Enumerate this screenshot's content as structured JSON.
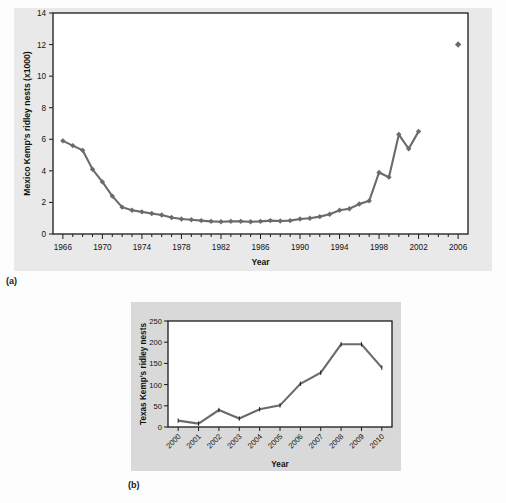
{
  "figure": {
    "panel_a_label": "(a)",
    "panel_b_label": "(b)"
  },
  "chart_data": [
    {
      "id": "panel-a",
      "type": "line",
      "title": "",
      "xlabel": "Year",
      "ylabel": "Mexico Kemp's ridley nests (x1000)",
      "xlim": [
        1965,
        2007
      ],
      "ylim": [
        0,
        14
      ],
      "ytick_values": [
        0,
        2,
        4,
        6,
        8,
        10,
        12,
        14
      ],
      "ytick_labels": [
        "0",
        "2",
        "4",
        "6",
        "8",
        "10",
        "12",
        "14"
      ],
      "xtick_labels": [
        "1966",
        "1970",
        "1974",
        "1978",
        "1982",
        "1986",
        "1990",
        "1994",
        "1998",
        "2002",
        "2006"
      ],
      "xtick_values": [
        1966,
        1970,
        1974,
        1978,
        1982,
        1986,
        1990,
        1994,
        1998,
        2002,
        2006
      ],
      "minor_tick_interval": 1,
      "grid": false,
      "legend": "none",
      "marker": "diamond",
      "line_color": "#6b6b6b",
      "x": [
        1966,
        1967,
        1968,
        1969,
        1970,
        1971,
        1972,
        1973,
        1974,
        1975,
        1976,
        1977,
        1978,
        1979,
        1980,
        1981,
        1982,
        1983,
        1984,
        1985,
        1986,
        1987,
        1988,
        1989,
        1990,
        1991,
        1992,
        1993,
        1994,
        1995,
        1996,
        1997,
        1998,
        1999,
        2000,
        2001,
        2002
      ],
      "values": [
        5.9,
        5.6,
        5.3,
        4.1,
        3.3,
        2.4,
        1.7,
        1.5,
        1.4,
        1.3,
        1.2,
        1.05,
        0.95,
        0.9,
        0.85,
        0.8,
        0.78,
        0.8,
        0.8,
        0.78,
        0.8,
        0.85,
        0.82,
        0.85,
        0.95,
        1.0,
        1.1,
        1.25,
        1.5,
        1.6,
        1.9,
        2.1,
        3.9,
        3.6,
        6.3,
        5.4,
        6.5
      ],
      "isolated_points": [
        {
          "x": 2006,
          "y": 12.0
        }
      ]
    },
    {
      "id": "panel-b",
      "type": "line",
      "title": "",
      "xlabel": "Year",
      "ylabel": "Texas Kemp's ridley nests",
      "ylim": [
        0,
        250
      ],
      "ytick_values": [
        0,
        50,
        100,
        150,
        200,
        250
      ],
      "ytick_labels": [
        "0",
        "50",
        "100",
        "150",
        "200",
        "250"
      ],
      "xtick_labels": [
        "2000",
        "2001",
        "2002",
        "2003",
        "2004",
        "2005",
        "2006",
        "2007",
        "2008",
        "2009",
        "2010"
      ],
      "xtick_rotation": -45,
      "grid": false,
      "legend": "none",
      "line_color": "#6b6b6b",
      "categories": [
        "2000",
        "2001",
        "2002",
        "2003",
        "2004",
        "2005",
        "2006",
        "2007",
        "2008",
        "2009",
        "2010"
      ],
      "values": [
        15,
        8,
        40,
        20,
        42,
        51,
        102,
        128,
        195,
        195,
        140
      ]
    }
  ]
}
